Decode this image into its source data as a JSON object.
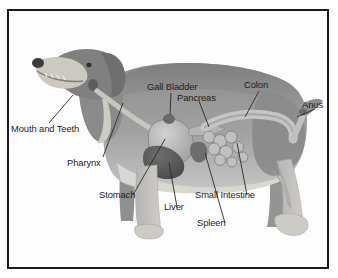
{
  "figure": {
    "kind": "anatomical-diagram",
    "border_color": "#1b1b1b",
    "background_color": "#ffffff",
    "label_color": "#1d1d1d",
    "palette": {
      "body_dark": "#8a8a8a",
      "body_mid": "#9d9d9d",
      "body_light": "#c3c3c3",
      "belly_pale": "#d8d6d1",
      "head_dark": "#7e7e7e",
      "organ_light": "#bdbdbd",
      "organ_mid": "#a0a0a0",
      "organ_dark": "#5f5f5f",
      "leader_line": "#2a2a2a"
    }
  },
  "labels": [
    {
      "id": "mouth-and-teeth",
      "text": "Mouth and Teeth"
    },
    {
      "id": "pharynx",
      "text": "Pharynx"
    },
    {
      "id": "gall-bladder",
      "text": "Gall Bladder"
    },
    {
      "id": "pancreas",
      "text": "Pancreas"
    },
    {
      "id": "colon",
      "text": "Colon"
    },
    {
      "id": "anus",
      "text": "Anus"
    },
    {
      "id": "stomach",
      "text": "Stomach"
    },
    {
      "id": "liver",
      "text": "Liver"
    },
    {
      "id": "spleen",
      "text": "Spleen"
    },
    {
      "id": "small-intestine",
      "text": "Small Intestine"
    }
  ]
}
